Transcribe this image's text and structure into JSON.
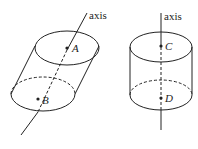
{
  "figures": [
    {
      "name": "oblique-cylinder",
      "axis_label": "axis",
      "points": [
        {
          "label": "A"
        },
        {
          "label": "B"
        }
      ]
    },
    {
      "name": "right-cylinder",
      "axis_label": "axis",
      "points": [
        {
          "label": "C"
        },
        {
          "label": "D"
        }
      ]
    }
  ],
  "colors": {
    "stroke": "#222222",
    "background": "#ffffff"
  }
}
